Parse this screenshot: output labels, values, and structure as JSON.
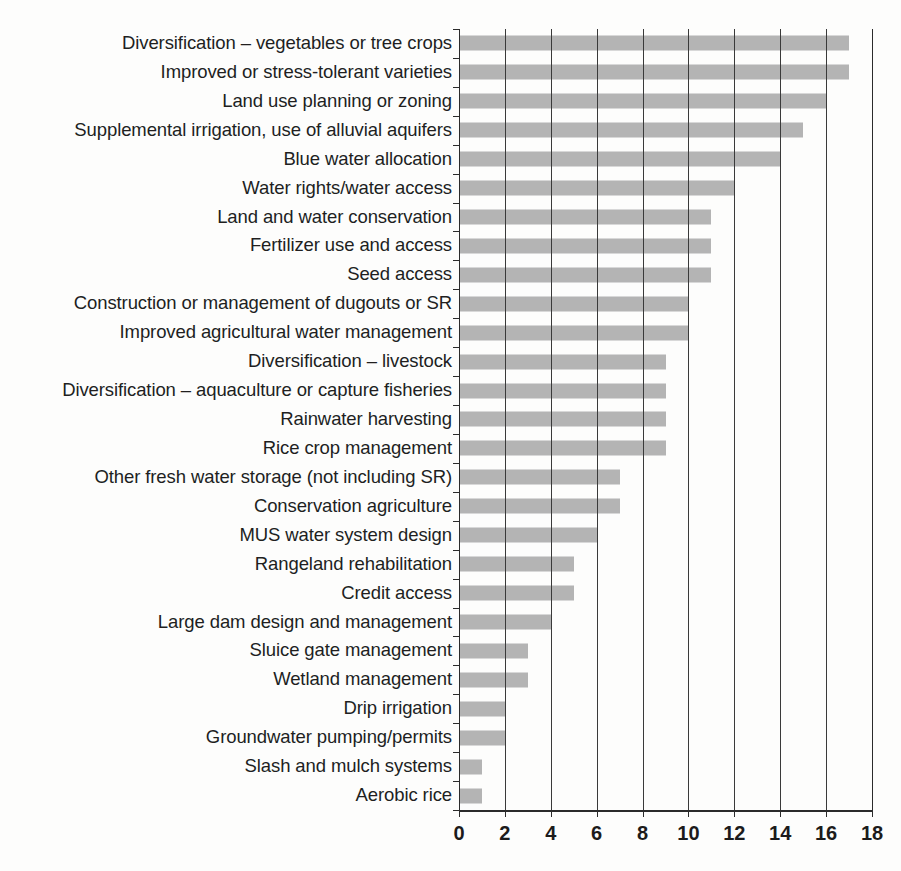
{
  "chart_data": {
    "type": "bar",
    "orientation": "horizontal",
    "title": "",
    "subtitle": "",
    "xlabel": "",
    "ylabel": "",
    "xlim": [
      0,
      18
    ],
    "xticks": [
      0,
      2,
      4,
      6,
      8,
      10,
      12,
      14,
      16,
      18
    ],
    "xtick_labels": [
      "0",
      "2",
      "4",
      "6",
      "8",
      "10",
      "12",
      "14",
      "16",
      "18"
    ],
    "grid": "vertical",
    "legend": "none",
    "bar_color": "#b4b4b4",
    "axis_color": "#2b2b2b",
    "text_color": "#211f1f",
    "categories": [
      "Diversification – vegetables or tree crops",
      "Improved or stress-tolerant varieties",
      "Land use planning or zoning",
      "Supplemental irrigation, use of alluvial aquifers",
      "Blue water allocation",
      "Water rights/water access",
      "Land and water conservation",
      "Fertilizer use and access",
      "Seed access",
      "Construction or management of dugouts or SR",
      "Improved agricultural water management",
      "Diversification – livestock",
      "Diversification – aquaculture or capture fisheries",
      "Rainwater harvesting",
      "Rice crop management",
      "Other fresh water storage (not including SR)",
      "Conservation agriculture",
      "MUS water system design",
      "Rangeland rehabilitation",
      "Credit access",
      "Large dam design and management",
      "Sluice gate management",
      "Wetland management",
      "Drip irrigation",
      "Groundwater pumping/permits",
      "Slash and mulch systems",
      "Aerobic rice"
    ],
    "values": [
      17,
      17,
      16,
      15,
      14,
      12,
      11,
      11,
      11,
      10,
      10,
      9,
      9,
      9,
      9,
      7,
      7,
      6,
      5,
      5,
      4,
      3,
      3,
      2,
      2,
      1,
      1
    ]
  }
}
